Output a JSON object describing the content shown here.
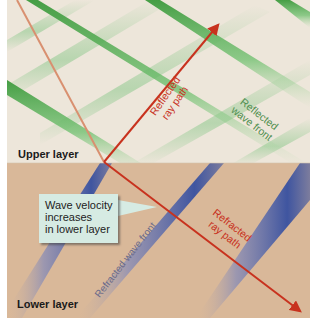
{
  "diagram": {
    "type": "seismic-refraction-reflection",
    "colors": {
      "upper_layer": "#ede6da",
      "lower_layer": "#d9b899",
      "reflected_front": "#4aa84a",
      "refracted_front": "#4a5fa0",
      "ray": "#c8321e",
      "incident_ray": "#d99070",
      "callout_bg": "#d6ebe3",
      "reflected_text": "#4f8f4f",
      "refracted_text": "#6a6a8a",
      "ray_text": "#c8321e"
    },
    "labels": {
      "upper_layer": "Upper layer",
      "lower_layer": "Lower layer",
      "reflected_ray_line1": "Reflected",
      "reflected_ray_line2": "ray path",
      "reflected_front_line1": "Reflected",
      "reflected_front_line2": "wave front",
      "refracted_ray_line1": "Refracted",
      "refracted_ray_line2": "ray path",
      "refracted_front": "Refracted wave front"
    },
    "callout": {
      "line1": "Wave velocity",
      "line2": "increases",
      "line3": "in lower layer"
    }
  }
}
